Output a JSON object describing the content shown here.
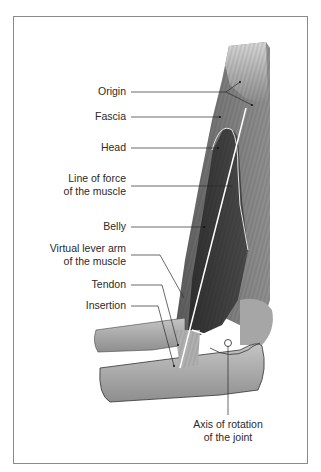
{
  "figure": {
    "labels": {
      "origin": "Origin",
      "fascia": "Fascia",
      "head": "Head",
      "line_of_force_1": "Line of force",
      "line_of_force_2": "of the muscle",
      "belly": "Belly",
      "lever_arm_1": "Virtual lever arm",
      "lever_arm_2": "of the muscle",
      "tendon": "Tendon",
      "insertion": "Insertion",
      "axis_1": "Axis of rotation",
      "axis_2": "of the joint"
    },
    "colors": {
      "border": "#8a8a8a",
      "muscle_dark": "#3a3a3a",
      "muscle_mid": "#6e6e6e",
      "bone_light": "#b8b8b8",
      "bone_mid": "#9a9a9a",
      "leader_line": "#2a2a2a",
      "force_line": "#ffffff"
    }
  }
}
